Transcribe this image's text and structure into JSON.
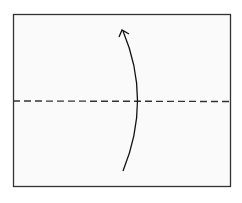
{
  "diagram": {
    "type": "origami-fold-step",
    "paper": {
      "fill": "#fafafa",
      "stroke": "#333333"
    },
    "fold_line": {
      "style": "valley-dashed",
      "color": "#333333"
    },
    "arrow": {
      "direction": "up",
      "meaning": "fold bottom half up along dashed line",
      "color": "#111111"
    }
  }
}
